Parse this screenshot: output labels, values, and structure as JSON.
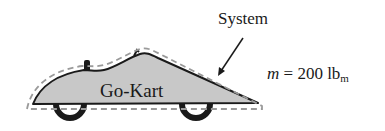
{
  "diagram": {
    "object_label": "Go-Kart",
    "boundary_label": "System",
    "mass": {
      "symbol": "m",
      "equals": "=",
      "value": "200",
      "unit": "lb",
      "unit_subscript": "m"
    },
    "colors": {
      "body_fill": "#c8c8c8",
      "outline": "#1a1a1a",
      "boundary_dash": "#9a9a9a",
      "wheel": "#1a1a1a"
    }
  }
}
